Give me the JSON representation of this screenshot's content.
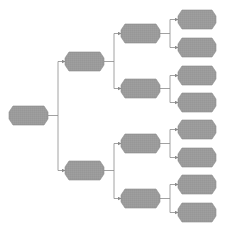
{
  "diagram": {
    "type": "tree",
    "orientation": "left-to-right",
    "colors": {
      "node_fill": "#9b9b9b",
      "node_edge": "#8c8c8c",
      "connector": "#8a8a8a",
      "background": "#ffffff"
    },
    "nodes": [
      {
        "id": "root",
        "level": 0,
        "x": 9,
        "y": 106,
        "w": 39,
        "h": 19,
        "label": ""
      },
      {
        "id": "l1-a",
        "level": 1,
        "x": 65,
        "y": 52,
        "w": 39,
        "h": 19,
        "label": ""
      },
      {
        "id": "l1-b",
        "level": 1,
        "x": 65,
        "y": 161,
        "w": 39,
        "h": 19,
        "label": ""
      },
      {
        "id": "l2-a",
        "level": 2,
        "x": 121,
        "y": 24,
        "w": 39,
        "h": 19,
        "label": ""
      },
      {
        "id": "l2-b",
        "level": 2,
        "x": 121,
        "y": 79,
        "w": 39,
        "h": 19,
        "label": ""
      },
      {
        "id": "l2-c",
        "level": 2,
        "x": 121,
        "y": 134,
        "w": 39,
        "h": 19,
        "label": ""
      },
      {
        "id": "l2-d",
        "level": 2,
        "x": 121,
        "y": 189,
        "w": 39,
        "h": 19,
        "label": ""
      },
      {
        "id": "l3-a",
        "level": 3,
        "x": 178,
        "y": 10,
        "w": 38,
        "h": 19,
        "label": ""
      },
      {
        "id": "l3-b",
        "level": 3,
        "x": 178,
        "y": 38,
        "w": 38,
        "h": 19,
        "label": ""
      },
      {
        "id": "l3-c",
        "level": 3,
        "x": 178,
        "y": 66,
        "w": 38,
        "h": 19,
        "label": ""
      },
      {
        "id": "l3-d",
        "level": 3,
        "x": 178,
        "y": 93,
        "w": 38,
        "h": 19,
        "label": ""
      },
      {
        "id": "l3-e",
        "level": 3,
        "x": 178,
        "y": 120,
        "w": 38,
        "h": 19,
        "label": ""
      },
      {
        "id": "l3-f",
        "level": 3,
        "x": 178,
        "y": 148,
        "w": 38,
        "h": 19,
        "label": ""
      },
      {
        "id": "l3-g",
        "level": 3,
        "x": 178,
        "y": 175,
        "w": 38,
        "h": 19,
        "label": ""
      },
      {
        "id": "l3-h",
        "level": 3,
        "x": 178,
        "y": 203,
        "w": 38,
        "h": 19,
        "label": ""
      }
    ],
    "edges": [
      {
        "from": "root",
        "to": "l1-a"
      },
      {
        "from": "root",
        "to": "l1-b"
      },
      {
        "from": "l1-a",
        "to": "l2-a"
      },
      {
        "from": "l1-a",
        "to": "l2-b"
      },
      {
        "from": "l1-b",
        "to": "l2-c"
      },
      {
        "from": "l1-b",
        "to": "l2-d"
      },
      {
        "from": "l2-a",
        "to": "l3-a"
      },
      {
        "from": "l2-a",
        "to": "l3-b"
      },
      {
        "from": "l2-b",
        "to": "l3-c"
      },
      {
        "from": "l2-b",
        "to": "l3-d"
      },
      {
        "from": "l2-c",
        "to": "l3-e"
      },
      {
        "from": "l2-c",
        "to": "l3-f"
      },
      {
        "from": "l2-d",
        "to": "l3-g"
      },
      {
        "from": "l2-d",
        "to": "l3-h"
      }
    ]
  }
}
